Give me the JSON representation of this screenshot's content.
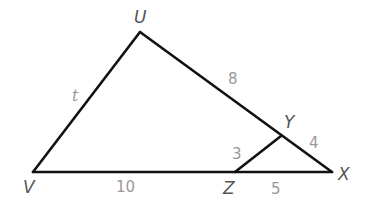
{
  "figure": {
    "vertices": {
      "U": {
        "label": "U",
        "x": 140,
        "y": 32
      },
      "V": {
        "label": "V",
        "x": 33,
        "y": 172
      },
      "X": {
        "label": "X",
        "x": 332,
        "y": 172
      },
      "Y": {
        "label": "Y",
        "x": 281,
        "y": 136
      },
      "Z": {
        "label": "Z",
        "x": 235,
        "y": 172
      }
    },
    "segments": [
      {
        "from": "U",
        "to": "V",
        "length_label": "t"
      },
      {
        "from": "U",
        "to": "Y",
        "length_label": "8"
      },
      {
        "from": "Y",
        "to": "X",
        "length_label": "4"
      },
      {
        "from": "V",
        "to": "Z",
        "length_label": "10"
      },
      {
        "from": "Z",
        "to": "X",
        "length_label": "5"
      },
      {
        "from": "Z",
        "to": "Y",
        "length_label": "3"
      }
    ],
    "labels": {
      "vertex_U": "U",
      "vertex_V": "V",
      "vertex_X": "X",
      "vertex_Y": "Y",
      "vertex_Z": "Z",
      "side_UV": "t",
      "side_UY": "8",
      "side_YX": "4",
      "side_VZ": "10",
      "side_ZX": "5",
      "side_ZY": "3"
    },
    "colors": {
      "line": "#111111",
      "vertex_label": "#555555",
      "measure_label": "#999999",
      "background": "#ffffff"
    }
  }
}
